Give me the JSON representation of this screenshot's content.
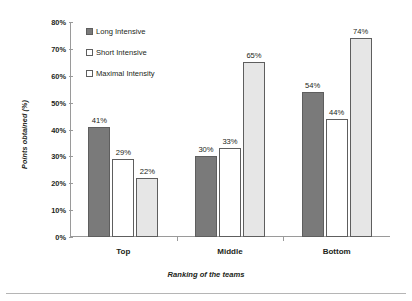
{
  "chart_data": {
    "type": "bar",
    "title": "",
    "xlabel": "Ranking of the teams",
    "ylabel": "Points obtained (%)",
    "categories": [
      "Top",
      "Middle",
      "Bottom"
    ],
    "series": [
      {
        "name": "Long Intensive",
        "values": [
          41,
          30,
          54
        ],
        "color": "#7a7a7a"
      },
      {
        "name": "Short Intensive",
        "values": [
          29,
          33,
          44
        ],
        "color": "#ffffff"
      },
      {
        "name": "Maximal Intensity",
        "values": [
          22,
          65,
          74
        ],
        "color": "#e6e6e6"
      }
    ],
    "data_labels": [
      [
        "41%",
        "29%",
        "22%"
      ],
      [
        "30%",
        "33%",
        "65%"
      ],
      [
        "54%",
        "44%",
        "74%"
      ]
    ],
    "ylim": [
      0,
      80
    ],
    "ytick_values": [
      0,
      10,
      20,
      30,
      40,
      50,
      60,
      70,
      80
    ],
    "ytick_labels": [
      "0%",
      "10%",
      "20%",
      "30%",
      "40%",
      "50%",
      "60%",
      "70%",
      "80%"
    ],
    "grid": false,
    "legend_position": "top-left-inside"
  },
  "axes": {
    "y_title": "Points obtained (%)",
    "x_title": "Ranking of the teams"
  },
  "legend": {
    "items": [
      {
        "label": "Long Intensive"
      },
      {
        "label": "Short Intensive"
      },
      {
        "label": "Maximal Intensity"
      }
    ]
  }
}
